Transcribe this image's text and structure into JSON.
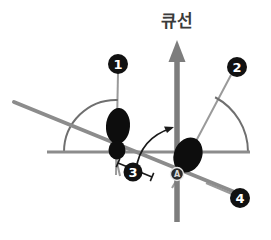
{
  "figure": {
    "background_color": "#ffffff",
    "axis_title": "큐선",
    "axis_title_color": "#3a3a3a",
    "colors": {
      "axis_gray": "#7d7d7d",
      "line_gray": "#8c8c8c",
      "thin_gray": "#9a9a9a",
      "blob_black": "#0d0d0d",
      "callout_fill": "#111111",
      "callout_text": "#ffffff",
      "point_marker_fill": "#2b2b2b",
      "point_marker_text": "#d9d9d9",
      "arc_stroke": "#6f6f6f",
      "curved_arrow": "#1a1a1a"
    },
    "callouts": [
      {
        "id": "callout-1",
        "label": "❶",
        "number": "1",
        "cx": 118,
        "cy": 64,
        "r": 10
      },
      {
        "id": "callout-2",
        "label": "❷",
        "number": "2",
        "cx": 237,
        "cy": 67,
        "r": 10
      },
      {
        "id": "callout-3",
        "label": "❸",
        "number": "3",
        "cx": 133,
        "cy": 172,
        "r": 9.5
      },
      {
        "id": "callout-4",
        "label": "❹",
        "number": "4",
        "cx": 240,
        "cy": 198,
        "r": 10
      }
    ],
    "point_markers": [
      {
        "id": "point-a",
        "label": "A",
        "cx": 177,
        "cy": 174,
        "r": 6.5
      }
    ],
    "vertical_axis": {
      "x": 177,
      "top_y": 40,
      "bottom_y": 222,
      "stroke_width": 5.5,
      "arrowhead": true
    },
    "horizontal_baseline": {
      "y": 152,
      "x_start": 47,
      "x_end": 250,
      "stroke_width": 3
    },
    "diagonal_line": {
      "x1": 14,
      "y1": 102,
      "x2": 237,
      "y2": 193,
      "stroke_width": 4
    },
    "thin_lines": [
      {
        "id": "line-callout-1",
        "x1": 118,
        "y1": 73,
        "x2": 116,
        "y2": 175
      },
      {
        "id": "line-callout-2",
        "x1": 231,
        "y1": 75,
        "x2": 186,
        "y2": 160
      },
      {
        "id": "line-callout-4",
        "x1": 232,
        "y1": 194,
        "x2": 206,
        "y2": 183
      },
      {
        "id": "tick-left",
        "x1": 116,
        "y1": 158,
        "x2": 120,
        "y2": 176
      },
      {
        "id": "tick-under-a",
        "x1": 172,
        "y1": 188,
        "x2": 179,
        "y2": 176
      }
    ],
    "arcs": [
      {
        "id": "arc-left",
        "cx": 116,
        "cy": 152,
        "r": 52,
        "start_deg": 180,
        "end_deg": 88
      },
      {
        "id": "arc-right",
        "cx": 186,
        "cy": 152,
        "r": 62,
        "start_deg": 0,
        "end_deg": 62
      }
    ],
    "curved_arrow": {
      "id": "rotation-arrow",
      "path": "M 136,170 Q 140,138 172,128",
      "arrow_tip_x": 174,
      "arrow_tip_y": 127
    },
    "measure_bar": {
      "id": "measure-3",
      "x1": 118,
      "y1": 163,
      "x2": 152,
      "y2": 177,
      "cap_length": 9
    },
    "blobs": [
      {
        "id": "blob-left-upper",
        "cx": 118,
        "cy": 126,
        "rx": 12,
        "ry": 18,
        "rotation": 4
      },
      {
        "id": "blob-left-lower",
        "cx": 117,
        "cy": 150,
        "rx": 8.5,
        "ry": 9.5,
        "rotation": 0
      },
      {
        "id": "blob-right",
        "cx": 188,
        "cy": 155,
        "rx": 14,
        "ry": 18,
        "rotation": 22
      }
    ]
  }
}
